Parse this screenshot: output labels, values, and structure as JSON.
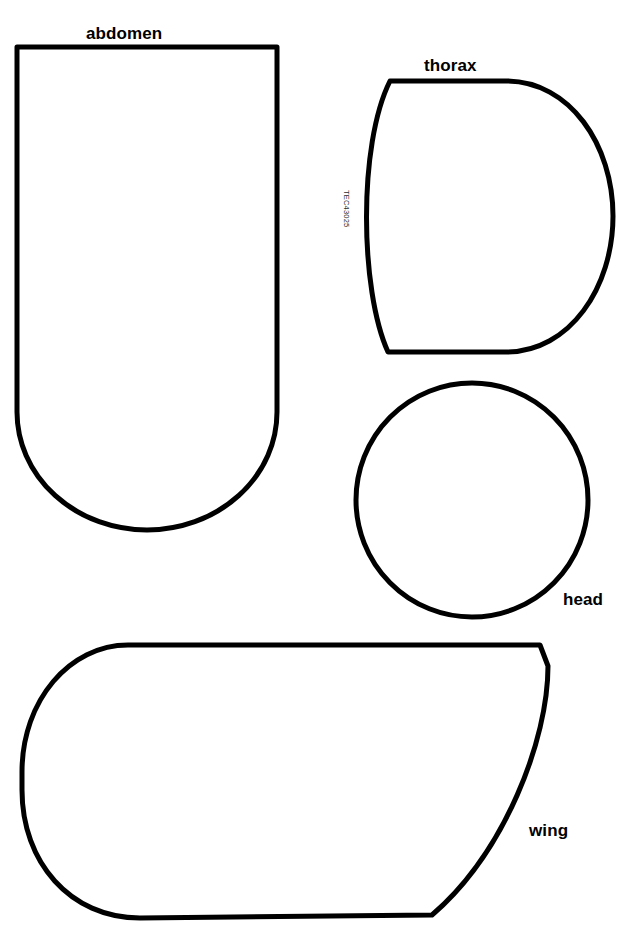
{
  "page": {
    "width": 619,
    "height": 928,
    "background_color": "#ffffff",
    "stroke_color": "#000000",
    "fill_color": "#ffffff"
  },
  "labels": {
    "abdomen": "abdomen",
    "thorax": "thorax",
    "head": "head",
    "wing": "wing"
  },
  "codes": {
    "template_id": "TEC43025"
  },
  "watermark": {
    "left": "",
    "mid": "",
    "right": ""
  },
  "shapes": {
    "abdomen": {
      "name": "abdomen",
      "description": "rounded-bottom rectangle",
      "path": "M 17 47 L 277 47 L 277 412 A 130 118 0 0 1 17 412 Z",
      "stroke_width": 5
    },
    "thorax": {
      "name": "thorax",
      "description": "rounded shield with flat top and bottom",
      "path": "M 390 81 L 506 81 C 570 81 613 145 613 216 C 613 287 570 352 506 352 L 388 352 C 360 290 358 145 390 81 Z",
      "stroke_width": 5
    },
    "head": {
      "name": "head",
      "description": "circle",
      "cx": 472,
      "cy": 500,
      "rx": 116,
      "ry": 117,
      "stroke_width": 5
    },
    "wing": {
      "name": "wing",
      "description": "rounded left end tapering to pointed upper-right",
      "path": "M 128 645 L 540 645 L 548 666 C 548 740 505 852 432 915 L 140 918 C 70 918 22 862 22 790 L 22 772 C 22 700 70 645 128 645 Z",
      "stroke_width": 5
    }
  }
}
